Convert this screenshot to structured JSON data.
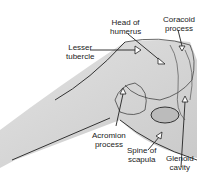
{
  "diagram": {
    "labels": [
      {
        "id": "head-of-humerus",
        "line1": "Head of",
        "line2": "humerus"
      },
      {
        "id": "coracoid-process",
        "line1": "Coracoid",
        "line2": "process"
      },
      {
        "id": "lesser-tubercle",
        "line1": "Lesser",
        "line2": "tubercle"
      },
      {
        "id": "acromion-process",
        "line1": "Acromion",
        "line2": "process"
      },
      {
        "id": "spine-of-scapula",
        "line1": "Spine of",
        "line2": "scapula"
      },
      {
        "id": "glenoid-cavity",
        "line1": "Glenoid",
        "line2": "cavity"
      }
    ]
  }
}
